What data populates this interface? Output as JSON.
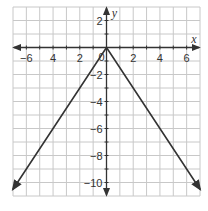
{
  "chart_data": {
    "type": "line",
    "title": "",
    "xlabel": "x",
    "ylabel": "y",
    "xlim": [
      -7,
      7
    ],
    "ylim": [
      -11,
      3
    ],
    "grid": true,
    "grid_step": 1,
    "x_tick_labels": [
      {
        "value": -6,
        "text": "−6"
      },
      {
        "value": -4,
        "text": "4"
      },
      {
        "value": -2,
        "text": "2"
      },
      {
        "value": 2,
        "text": "2"
      },
      {
        "value": 4,
        "text": "4"
      },
      {
        "value": 6,
        "text": "6"
      }
    ],
    "y_tick_labels": [
      {
        "value": 2,
        "text": "2"
      },
      {
        "value": -2,
        "text": "−2"
      },
      {
        "value": -4,
        "text": "−4"
      },
      {
        "value": -6,
        "text": "−6"
      },
      {
        "value": -8,
        "text": "−8"
      },
      {
        "value": -10,
        "text": "−10"
      }
    ],
    "origin_label": "0",
    "series": [
      {
        "name": "y = -1.5|x|",
        "points": [
          [
            -7,
            -10.5
          ],
          [
            0,
            0
          ],
          [
            7,
            -10.5
          ]
        ],
        "arrows_at_ends": true,
        "color": "#333333"
      }
    ]
  },
  "colors": {
    "grid": "#c8c8c8",
    "axis": "#333333",
    "line": "#333333",
    "background": "#ffffff"
  }
}
